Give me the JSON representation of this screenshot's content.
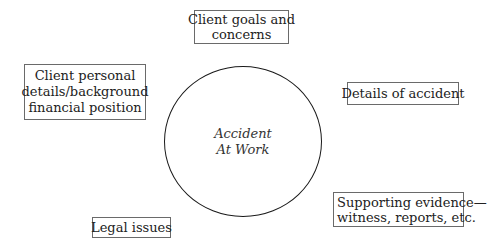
{
  "diagram": {
    "center": {
      "lines": [
        "Accident",
        "At Work"
      ]
    },
    "nodes": [
      {
        "id": "client-goals",
        "lines": [
          "Client goals and",
          "concerns"
        ]
      },
      {
        "id": "client-personal",
        "lines": [
          "Client personal",
          "details/background",
          "financial position"
        ]
      },
      {
        "id": "details-accident",
        "lines": [
          "Details of accident"
        ]
      },
      {
        "id": "supporting-evidence",
        "lines": [
          "Supporting evidence—",
          "witness, reports, etc."
        ]
      },
      {
        "id": "legal-issues",
        "lines": [
          "Legal issues"
        ]
      }
    ]
  }
}
